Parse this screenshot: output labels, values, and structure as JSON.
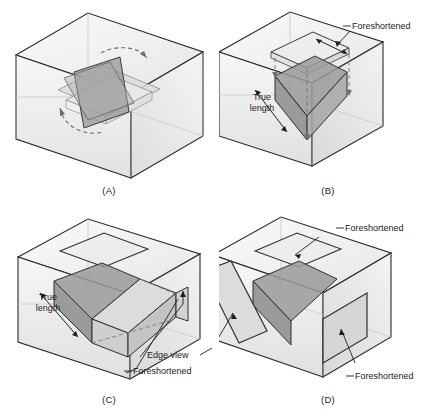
{
  "figure": {
    "type": "technical-illustration",
    "background_color": "#ffffff",
    "line_color": "#1a1a1a",
    "inclined_plane_color": "#9a9a9a",
    "projection_plane_color": "#c9c9c9",
    "box_face_color": "#f2f2f2"
  },
  "panels": [
    {
      "id": "A",
      "caption": "(A)",
      "labels": [],
      "annotations": [
        "rotation-arrow-upper",
        "rotation-arrow-lower"
      ],
      "description": "Inclined plane rotating inside glass box with curved dashed rotation arrows"
    },
    {
      "id": "B",
      "caption": "(B)",
      "labels": [
        {
          "name": "foreshortened-top",
          "text": "Foreshortened",
          "x": 352,
          "y": 26
        },
        {
          "name": "true-length-left",
          "text": "True length",
          "x": 243,
          "y": 97
        }
      ],
      "annotations": [
        "dimension-arrow-top",
        "dimension-arrow-left",
        "projector-lines"
      ],
      "description": "Inclined plane projected to top plane shows foreshortened; left edge shows true length"
    },
    {
      "id": "C",
      "caption": "(C)",
      "labels": [
        {
          "name": "true-length-left",
          "text": "True length",
          "x": 28,
          "y": 289
        },
        {
          "name": "edge-view",
          "text": "Edge view",
          "x": 143,
          "y": 355
        },
        {
          "name": "foreshortened-right",
          "text": "Foreshortened",
          "x": 133,
          "y": 371
        }
      ],
      "annotations": [
        "dimension-arrow-left",
        "leader-line-edge-view",
        "leader-line-foreshortened"
      ],
      "description": "Front projection plane shown with true length, edge view and foreshortened callouts"
    },
    {
      "id": "D",
      "caption": "(D)",
      "labels": [
        {
          "name": "foreshortened-top",
          "text": "Foreshortened",
          "x": 345,
          "y": 228
        },
        {
          "name": "foreshortened-right",
          "text": "Foreshortened",
          "x": 355,
          "y": 376
        }
      ],
      "annotations": [
        "arrow-to-top-plane",
        "arrow-to-right-plane",
        "arrow-to-edge-view-plane"
      ],
      "description": "Three projection planes unfolded: top foreshortened, right foreshortened, left edge view"
    }
  ],
  "terms": {
    "foreshortened": "Foreshortened",
    "true_length": "True length",
    "edge_view": "Edge view"
  }
}
